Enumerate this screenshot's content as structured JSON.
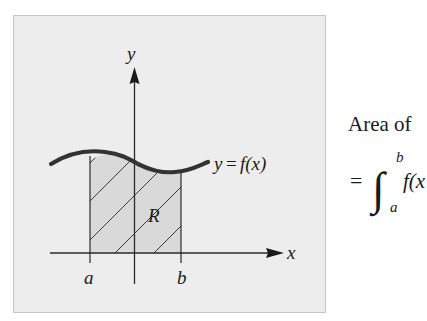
{
  "figure": {
    "axes": {
      "x_label": "x",
      "y_label": "y"
    },
    "curve_label": {
      "lhs": "y",
      "eq": "=",
      "rhs": "f(x)"
    },
    "region_label": "R",
    "bounds": {
      "lower": "a",
      "upper": "b"
    },
    "colors": {
      "panel_background": "#ededed",
      "panel_border": "#c6c6c6",
      "region_fill": "#d9d9d9",
      "curve": "#333333",
      "lines": "#2a2a2a"
    }
  },
  "formula": {
    "line1": "Area of",
    "equals": "=",
    "integral_sign": "∫",
    "upper_limit": "b",
    "lower_limit": "a",
    "integrand": "f(x"
  }
}
